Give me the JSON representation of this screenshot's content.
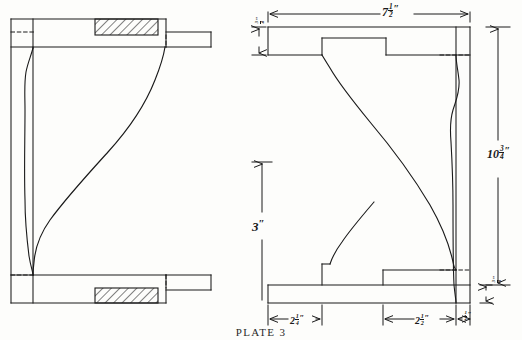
{
  "plate": {
    "caption": "PLATE 3"
  },
  "drawing": {
    "title": "Plate 3",
    "subject": "Two cross-sectional elevation views of a moulded architectural bracket",
    "line_color": "#1a1a1a",
    "background_color": "#fdfdfb",
    "hatch_color": "#1a1a1a"
  },
  "views": {
    "left": {
      "name": "left-section-view",
      "description": "Mirrored half section with two cross-hatched bearing blocks at top and bottom"
    },
    "right": {
      "name": "right-section-view",
      "description": "Dimensioned half section with stepped lower shelf and notched upper shelf"
    }
  },
  "dimensions": {
    "top_width": {
      "whole": "7",
      "num": "1",
      "den": "2",
      "unit": "″",
      "orientation": "horizontal",
      "label": "7 1/2″"
    },
    "right_height": {
      "whole": "10",
      "num": "3",
      "den": "4",
      "unit": "″",
      "orientation": "vertical",
      "label": "10 3/4″"
    },
    "center_height": {
      "whole": "3",
      "num": "",
      "den": "",
      "unit": "″",
      "orientation": "vertical",
      "label": "3″"
    },
    "bottom_left": {
      "whole": "2",
      "num": "1",
      "den": "4",
      "unit": "″",
      "orientation": "horizontal",
      "label": "2 1/4″"
    },
    "bottom_right": {
      "whole": "2",
      "num": "1",
      "den": "2",
      "unit": "″",
      "orientation": "horizontal",
      "label": "2 1/2″"
    },
    "bottom_tiny": {
      "whole": "",
      "num": "1",
      "den": "2",
      "unit": "″",
      "orientation": "horizontal",
      "label": "1/2″"
    },
    "top_tiny": {
      "whole": "",
      "num": "3",
      "den": "4",
      "unit": "″",
      "orientation": "vertical",
      "label": "3/4″"
    },
    "right_tiny": {
      "whole": "",
      "num": "3",
      "den": "4",
      "unit": "″",
      "orientation": "vertical",
      "label": "3/4″"
    }
  }
}
